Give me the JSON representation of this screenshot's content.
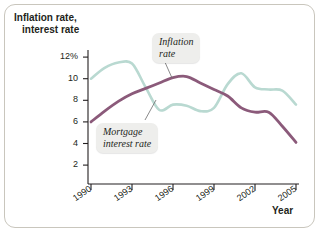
{
  "figure": {
    "y_axis_title_line1": "Inflation rate,",
    "y_axis_title_line2": "interest rate",
    "x_axis_title": "Year"
  },
  "callouts": {
    "inflation": {
      "line1": "Inflation",
      "line2": "rate"
    },
    "mortgage": {
      "line1": "Mortgage",
      "line2": "interest rate"
    }
  },
  "ticks": {
    "y": [
      "12%",
      "10",
      "8",
      "6",
      "4",
      "2"
    ],
    "x": [
      "1990",
      "1993",
      "1996",
      "1999",
      "2002",
      "2005"
    ]
  },
  "colors": {
    "inflation_rate_line": "#8b5a7a",
    "mortgage_interest_rate_line": "#b9d9d1",
    "axis": "#231f20",
    "frame_border": "#c9c6bd",
    "callout_background": "#eeeeec"
  },
  "chart_data": {
    "type": "line",
    "title": "",
    "subtitle": "",
    "xlabel": "Year",
    "ylabel": "Inflation rate, interest rate",
    "xlim": [
      1990,
      2005
    ],
    "ylim": [
      0,
      13
    ],
    "yticks": [
      2,
      4,
      6,
      8,
      10,
      12
    ],
    "ytick_labels": [
      "2",
      "4",
      "6",
      "8",
      "10",
      "12%"
    ],
    "xticks": [
      1990,
      1993,
      1996,
      1999,
      2002,
      2005
    ],
    "grid": false,
    "legend": "annotated-callouts",
    "x": [
      1990,
      1991,
      1992,
      1993,
      1994,
      1995,
      1996,
      1997,
      1998,
      1999,
      2000,
      2001,
      2002,
      2003,
      2004,
      2005
    ],
    "series": [
      {
        "name": "Inflation rate",
        "color": "#8b5a7a",
        "values": [
          6.0,
          7.0,
          7.9,
          8.6,
          9.1,
          9.6,
          10.1,
          10.2,
          9.6,
          9.0,
          8.4,
          7.3,
          6.9,
          6.9,
          5.6,
          4.1
        ]
      },
      {
        "name": "Mortgage interest rate",
        "color": "#b9d9d1",
        "values": [
          10.0,
          11.0,
          11.5,
          11.4,
          9.2,
          7.1,
          7.6,
          7.5,
          7.0,
          7.3,
          9.5,
          10.5,
          9.2,
          9.0,
          8.9,
          7.6
        ]
      }
    ],
    "annotations": [
      {
        "text": "Inflation rate",
        "points_to_series": "Inflation rate",
        "x": 1997
      },
      {
        "text": "Mortgage interest rate",
        "points_to_series": "Mortgage interest rate",
        "x": 1996
      }
    ]
  }
}
